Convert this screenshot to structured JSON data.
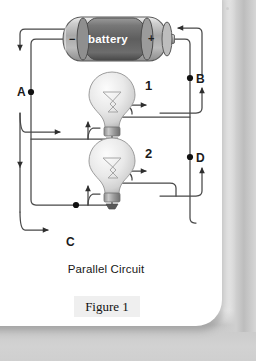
{
  "figure": {
    "title": "Parallel Circuit",
    "figure_label": "Figure 1",
    "battery_label": "battery",
    "battery_negative": "−",
    "battery_positive": "+",
    "node_labels": {
      "a": "A",
      "b": "B",
      "c": "C",
      "d": "D"
    },
    "branch_labels": {
      "one": "1",
      "two": "2"
    },
    "colors": {
      "page": "#ffffff",
      "backdrop": "#d2d2d2",
      "wire": "#3a3a3a",
      "node": "#111111",
      "battery_body": "#b4b4b4",
      "battery_center": "#6e6e6e",
      "figure_box": "#efefef",
      "text": "#171717"
    },
    "components": [
      {
        "name": "battery",
        "label": "battery"
      },
      {
        "name": "bulb-1",
        "label": "1"
      },
      {
        "name": "bulb-2",
        "label": "2"
      }
    ]
  }
}
